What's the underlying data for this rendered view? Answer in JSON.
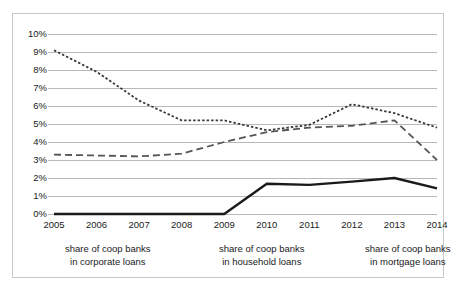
{
  "chart_data": {
    "type": "line",
    "title": "",
    "subtitle": "",
    "xlabel": "",
    "ylabel": "",
    "x": [
      "2005",
      "2006",
      "2007",
      "2008",
      "2009",
      "2010",
      "2011",
      "2012",
      "2013",
      "2014"
    ],
    "categories": [
      "2005",
      "2006",
      "2007",
      "2008",
      "2009",
      "2010",
      "2011",
      "2012",
      "2013",
      "2014"
    ],
    "ylim": [
      0,
      10
    ],
    "ytick_labels": [
      "0%",
      "1%",
      "2%",
      "3%",
      "4%",
      "5%",
      "6%",
      "7%",
      "8%",
      "9%",
      "10%"
    ],
    "ytick_values": [
      0,
      1,
      2,
      3,
      4,
      5,
      6,
      7,
      8,
      9,
      10
    ],
    "grid": true,
    "grid_axis": "y",
    "legend_position": "bottom",
    "units": "percent",
    "series": [
      {
        "name": "share of coop banks in corporate loans",
        "name_line1": "share of coop banks",
        "name_line2": "in corporate loans",
        "style": "long-dash",
        "color": "#555555",
        "values": [
          3.3,
          3.25,
          3.2,
          3.35,
          4.0,
          4.55,
          4.8,
          4.9,
          5.2,
          3.0
        ]
      },
      {
        "name": "share of coop banks in household loans",
        "name_line1": "share of coop banks",
        "name_line2": "in household loans",
        "style": "short-dash",
        "color": "#3a3a3a",
        "values": [
          9.1,
          7.9,
          6.3,
          5.2,
          5.2,
          4.65,
          4.95,
          6.1,
          5.6,
          4.8
        ]
      },
      {
        "name": "share of coop banks in mortgage loans",
        "name_line1": "share of coop banks",
        "name_line2": "in mortgage loans",
        "style": "solid",
        "color": "#1a1a1a",
        "values": [
          0.0,
          0.0,
          0.0,
          0.0,
          0.0,
          1.68,
          1.62,
          1.8,
          2.0,
          1.42
        ]
      }
    ]
  },
  "colors": {
    "border": "#c8c8c8",
    "grid": "#b8b8b8",
    "text": "#1a1a1a",
    "background": "#ffffff"
  }
}
